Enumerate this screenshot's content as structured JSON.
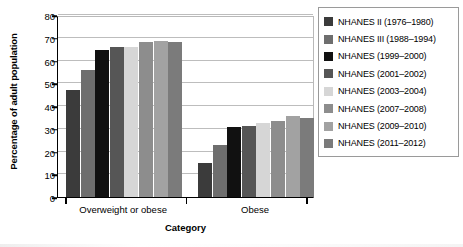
{
  "chart_data": {
    "type": "bar",
    "title": "",
    "xlabel": "Category",
    "ylabel": "Percentage of adult population",
    "categories": [
      "Overweight or obese",
      "Obese"
    ],
    "ylim": [
      0,
      80
    ],
    "yticks": [
      0,
      10,
      20,
      30,
      40,
      50,
      60,
      70,
      80
    ],
    "grid": true,
    "legend_position": "right",
    "series": [
      {
        "name": "NHANES II (1976–1980)",
        "color": "#3b3b3b",
        "values": [
          47.0,
          15.0
        ]
      },
      {
        "name": "NHANES III (1988–1994)",
        "color": "#6e6e6e",
        "values": [
          56.0,
          23.0
        ]
      },
      {
        "name": "NHANES (1999–2000)",
        "color": "#111111",
        "values": [
          64.5,
          30.8
        ]
      },
      {
        "name": "NHANES (2001–2002)",
        "color": "#565656",
        "values": [
          65.8,
          31.2
        ]
      },
      {
        "name": "NHANES (2003–2004)",
        "color": "#d6d6d6",
        "values": [
          66.0,
          32.7
        ]
      },
      {
        "name": "NHANES (2007–2008)",
        "color": "#8d8d8d",
        "values": [
          68.0,
          33.6
        ]
      },
      {
        "name": "NHANES (2009–2010)",
        "color": "#a2a2a2",
        "values": [
          68.5,
          35.5
        ]
      },
      {
        "name": "NHANES (2011–2012)",
        "color": "#7b7b7b",
        "values": [
          68.3,
          34.7
        ]
      }
    ]
  },
  "legend": {
    "items": [
      {
        "label": "NHANES II (1976–1980)",
        "color": "#3b3b3b"
      },
      {
        "label": "NHANES III (1988–1994)",
        "color": "#6e6e6e"
      },
      {
        "label": "NHANES (1999–2000)",
        "color": "#111111"
      },
      {
        "label": "NHANES (2001–2002)",
        "color": "#565656"
      },
      {
        "label": "NHANES (2003–2004)",
        "color": "#d6d6d6"
      },
      {
        "label": "NHANES (2007–2008)",
        "color": "#8d8d8d"
      },
      {
        "label": "NHANES (2009–2010)",
        "color": "#a2a2a2"
      },
      {
        "label": "NHANES (2011–2012)",
        "color": "#7b7b7b"
      }
    ]
  }
}
